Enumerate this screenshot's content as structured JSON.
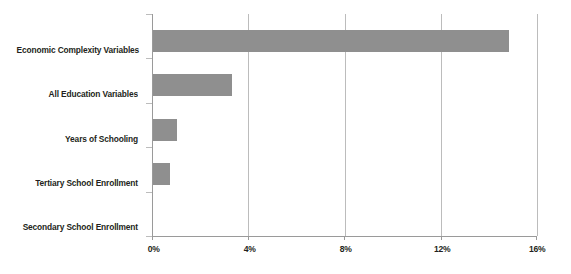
{
  "chart_data": {
    "type": "bar",
    "orientation": "horizontal",
    "title": "",
    "xlabel": "",
    "ylabel": "",
    "categories": [
      "Economic Complexity Variables",
      "All Education Variables",
      "Years of Schooling",
      "Tertiary School Enrollment",
      "Secondary School Enrollment"
    ],
    "values": [
      14.8,
      3.3,
      1.0,
      0.7,
      0.0
    ],
    "value_unit": "%",
    "xlim": [
      0,
      16
    ],
    "xticks": [
      0,
      4,
      8,
      12,
      16
    ],
    "xtick_labels": [
      "0%",
      "4%",
      "8%",
      "12%",
      "16%"
    ],
    "grid": true,
    "grid_axis": "x",
    "legend": false,
    "bar_color": "#8f8f8f",
    "axis_color": "#9a9a9a",
    "grid_color": "#bcbcbc",
    "text_color": "#231f20",
    "background": "#ffffff"
  }
}
